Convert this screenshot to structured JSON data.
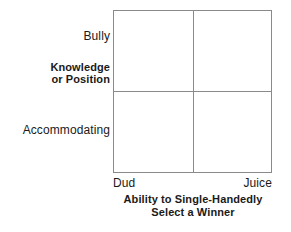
{
  "chart_data": {
    "type": "scatter",
    "title": "",
    "subtitle": "",
    "grid": false,
    "legend": null,
    "axes": {
      "y": {
        "title_line1": "Knowledge",
        "title_line2": "or Position",
        "high_label": "Bully",
        "low_label": "Accommodating",
        "ticks": [
          "Accommodating",
          "Bully"
        ]
      },
      "x": {
        "title_line1": "Ability to Single-Handedly",
        "title_line2": "Select a Winner",
        "low_label": "Dud",
        "high_label": "Juice",
        "ticks": [
          "Dud",
          "Juice"
        ]
      }
    },
    "quadrants": [
      {
        "position": "top-left",
        "label": ""
      },
      {
        "position": "top-right",
        "label": ""
      },
      {
        "position": "bottom-left",
        "label": ""
      },
      {
        "position": "bottom-right",
        "label": ""
      }
    ],
    "series": [],
    "values": [],
    "categories": []
  },
  "colors": {
    "background": "#ffffff",
    "line": "#8a8a8a",
    "text": "#1a1a1a"
  }
}
